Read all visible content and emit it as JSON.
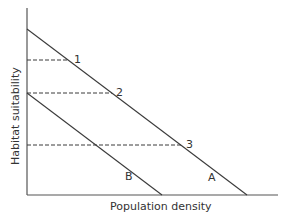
{
  "diagram": {
    "xlabel": "Population density",
    "ylabel": "Habitat suitability",
    "lines": [
      {
        "name": "A",
        "label": "A"
      },
      {
        "name": "B",
        "label": "B"
      }
    ],
    "points": [
      {
        "label": "1"
      },
      {
        "label": "2"
      },
      {
        "label": "3"
      }
    ],
    "colors": {
      "line": "#3a3a3a",
      "dash": "#3a3a3a",
      "text": "#333333"
    }
  }
}
